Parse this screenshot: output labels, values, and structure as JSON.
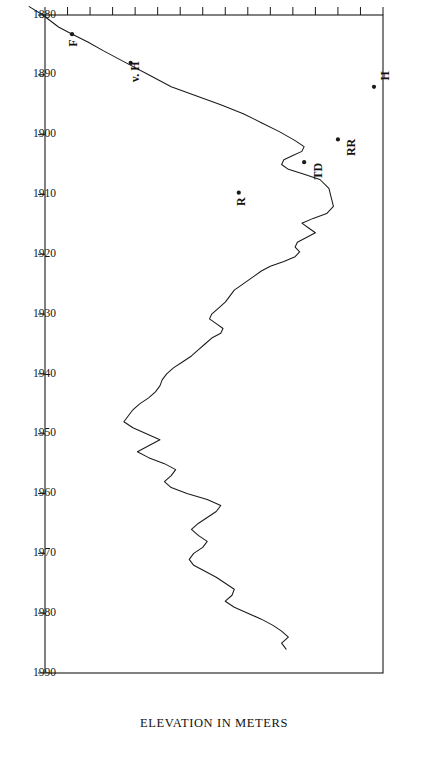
{
  "figure": {
    "orientation": "rotated-180",
    "background_color": "#ffffff",
    "line_color": "#1a1a1a"
  },
  "chart_data": {
    "type": "line",
    "title": "",
    "subtitle": "",
    "xlabel": "",
    "ylabel": "ELEVATION IN METERS",
    "x_axis_name": "year",
    "y_axis_name": "elevation",
    "grid": false,
    "legend": "none",
    "xlim": [
      1880,
      1990
    ],
    "ylim": [
      1881,
      1896
    ],
    "x_ticks": [
      1880,
      1890,
      1900,
      1910,
      1920,
      1930,
      1940,
      1950,
      1960,
      1970,
      1980,
      1990
    ],
    "x_tick_labels": [
      "1880",
      "1890",
      "1900",
      "1910",
      "1920",
      "1930",
      "1940",
      "1950",
      "1960",
      "1970",
      "1980",
      "1990"
    ],
    "y_ticks": [
      1896,
      1895,
      1894,
      1893,
      1892,
      1891,
      1890,
      1889,
      1888,
      1887,
      1886,
      1885,
      1884,
      1883,
      1882,
      1881
    ],
    "y_tick_labels": [
      "1896",
      "1895",
      "1894",
      "1893",
      "1892",
      "1891",
      "1890",
      "1889",
      "1888",
      "1887",
      "1886",
      "1885",
      "1884",
      "1883",
      "1882",
      "1881"
    ],
    "y_axis_reversed": true,
    "series": [
      {
        "name": "lake elevation",
        "x": [
          1878.6,
          1880.0,
          1882.0,
          1883.0,
          1884.5,
          1886.0,
          1888.0,
          1890.0,
          1892.0,
          1893.5,
          1895.0,
          1896.5,
          1898.0,
          1899.5,
          1901.0,
          1902.0,
          1902.8,
          1903.5,
          1904.2,
          1905.0,
          1905.8,
          1906.5,
          1907.5,
          1909.0,
          1910.5,
          1912.0,
          1913.2,
          1914.0,
          1914.8,
          1915.6,
          1916.4,
          1917.2,
          1918.0,
          1918.8,
          1919.6,
          1920.4,
          1921.2,
          1922.0,
          1922.8,
          1923.6,
          1924.4,
          1925.2,
          1926.0,
          1927.0,
          1928.0,
          1929.0,
          1930.0,
          1930.8,
          1931.6,
          1932.4,
          1933.2,
          1934.0,
          1935.0,
          1936.0,
          1937.0,
          1938.0,
          1939.0,
          1940.0,
          1941.0,
          1942.0,
          1943.0,
          1944.0,
          1945.0,
          1946.0,
          1947.0,
          1948.0,
          1949.0,
          1950.0,
          1951.0,
          1952.0,
          1953.0,
          1954.0,
          1955.0,
          1956.0,
          1957.0,
          1958.0,
          1959.0,
          1960.0,
          1961.0,
          1962.0,
          1963.0,
          1964.0,
          1965.0,
          1966.0,
          1967.0,
          1968.0,
          1969.0,
          1970.0,
          1971.0,
          1972.0,
          1973.0,
          1974.0,
          1975.0,
          1976.0,
          1977.0,
          1978.0,
          1979.0,
          1980.0,
          1981.0,
          1982.0,
          1983.0,
          1984.0,
          1985.0,
          1986.0
        ],
        "y": [
          1880.3,
          1880.9,
          1881.6,
          1882.1,
          1882.9,
          1883.6,
          1884.6,
          1885.6,
          1886.6,
          1887.7,
          1888.8,
          1889.8,
          1890.6,
          1891.4,
          1892.1,
          1892.5,
          1892.4,
          1892.0,
          1891.6,
          1891.5,
          1891.8,
          1892.4,
          1893.2,
          1893.6,
          1893.7,
          1893.8,
          1893.5,
          1892.9,
          1892.4,
          1892.7,
          1893.0,
          1892.6,
          1892.2,
          1892.1,
          1892.3,
          1892.1,
          1891.6,
          1891.0,
          1890.6,
          1890.3,
          1890.0,
          1889.7,
          1889.4,
          1889.2,
          1889.0,
          1888.7,
          1888.4,
          1888.3,
          1888.6,
          1888.9,
          1888.8,
          1888.4,
          1888.1,
          1887.8,
          1887.5,
          1887.1,
          1886.7,
          1886.4,
          1886.2,
          1886.1,
          1885.9,
          1885.6,
          1885.2,
          1884.9,
          1884.7,
          1884.5,
          1884.9,
          1885.5,
          1886.1,
          1885.6,
          1885.1,
          1885.6,
          1886.3,
          1886.8,
          1886.6,
          1886.3,
          1886.6,
          1887.3,
          1888.2,
          1888.8,
          1888.6,
          1888.2,
          1887.8,
          1887.5,
          1887.8,
          1888.2,
          1888.0,
          1887.6,
          1887.4,
          1887.6,
          1888.1,
          1888.6,
          1889.0,
          1889.4,
          1889.3,
          1889.0,
          1889.4,
          1890.0,
          1890.6,
          1891.1,
          1891.5,
          1891.8,
          1891.5,
          1891.7
        ]
      }
    ],
    "annotations": [
      {
        "label": "H",
        "x": 1892.0,
        "y": 1895.6,
        "dx": -12,
        "dy": 11
      },
      {
        "label": "RR",
        "x": 1900.8,
        "y": 1894.0,
        "dx": -14,
        "dy": -8
      },
      {
        "label": "TD",
        "x": 1904.6,
        "y": 1892.5,
        "dx": -15,
        "dy": -9
      },
      {
        "label": "R",
        "x": 1909.7,
        "y": 1889.6,
        "dx": -3,
        "dy": -9
      },
      {
        "label": "v. H",
        "x": 1888.0,
        "y": 1884.8,
        "dx": -6,
        "dy": -9
      },
      {
        "label": "F",
        "x": 1883.2,
        "y": 1882.2,
        "dx": -2,
        "dy": -9
      }
    ],
    "annotation_marker_radius": 2.1
  }
}
